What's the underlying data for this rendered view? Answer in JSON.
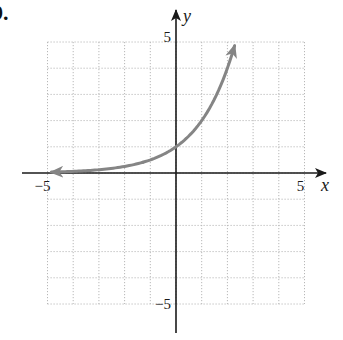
{
  "problem": {
    "label": "9."
  },
  "axes": {
    "x_label": "x",
    "y_label": "y",
    "x_ticks": [
      {
        "value": -5,
        "label": "−5"
      },
      {
        "value": 5,
        "label": "5"
      }
    ],
    "y_ticks": [
      {
        "value": 5,
        "label": "5"
      },
      {
        "value": -5,
        "label": "−5"
      }
    ],
    "xlim": [
      -5,
      5
    ],
    "ylim": [
      -5,
      5
    ],
    "grid": true,
    "grid_step": 1
  },
  "curve": {
    "equation": "y = 2^x",
    "color": "#858585",
    "x_start": -4.85,
    "x_end": 2.28,
    "arrows": "both"
  },
  "colors": {
    "axis": "#1a1a1a",
    "grid": "#b8b8b8",
    "curve": "#858585"
  }
}
